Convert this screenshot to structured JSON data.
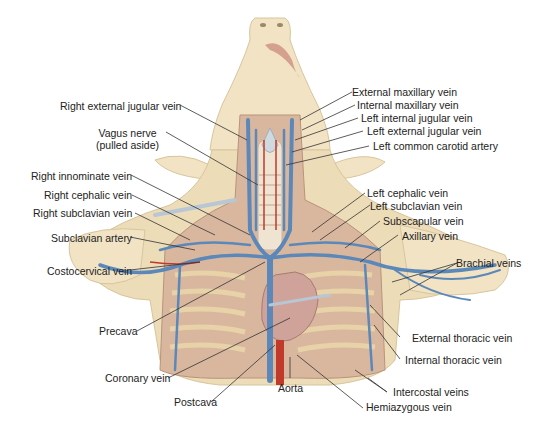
{
  "diagram": {
    "colors": {
      "skin": "#f1e3c4",
      "skin_shade": "#e3cfa4",
      "muscle": "#d9b79e",
      "vein": "#5b88b8",
      "artery": "#c0392b",
      "heart": "#cfa39a",
      "rib": "#e8d2a8",
      "line": "#333333"
    },
    "labels_left": [
      {
        "id": "right-external-jugular-vein",
        "text": "Right external jugular vein"
      },
      {
        "id": "vagus-nerve",
        "text": "Vagus nerve",
        "subtext": "(pulled aside)"
      },
      {
        "id": "right-innominate-vein",
        "text": "Right innominate vein"
      },
      {
        "id": "right-cephalic-vein",
        "text": "Right cephalic vein"
      },
      {
        "id": "right-subclavian-vein",
        "text": "Right subclavian vein"
      },
      {
        "id": "subclavian-artery",
        "text": "Subclavian artery"
      },
      {
        "id": "costocervical-vein",
        "text": "Costocervical vein"
      },
      {
        "id": "precava",
        "text": "Precava"
      },
      {
        "id": "coronary-vein",
        "text": "Coronary vein"
      }
    ],
    "labels_right": [
      {
        "id": "external-maxillary-vein",
        "text": "External maxillary vein"
      },
      {
        "id": "internal-maxillary-vein",
        "text": "Internal maxillary vein"
      },
      {
        "id": "left-internal-jugular-vein",
        "text": "Left internal jugular vein"
      },
      {
        "id": "left-external-jugular-vein",
        "text": "Left external jugular vein"
      },
      {
        "id": "left-common-carotid-artery",
        "text": "Left common carotid artery"
      },
      {
        "id": "left-cephalic-vein",
        "text": "Left cephalic vein"
      },
      {
        "id": "left-subclavian-vein",
        "text": "Left subclavian vein"
      },
      {
        "id": "subscapular-vein",
        "text": "Subscapular vein"
      },
      {
        "id": "axillary-vein",
        "text": "Axillary vein"
      },
      {
        "id": "brachial-veins",
        "text": "Brachial veins"
      },
      {
        "id": "external-thoracic-vein",
        "text": "External thoracic vein"
      },
      {
        "id": "internal-thoracic-vein",
        "text": "Internal thoracic vein"
      },
      {
        "id": "intercostal-veins",
        "text": "Intercostal veins"
      },
      {
        "id": "hemiazygous-vein",
        "text": "Hemiazygous vein"
      }
    ],
    "labels_bottom": [
      {
        "id": "postcava",
        "text": "Postcava"
      },
      {
        "id": "aorta",
        "text": "Aorta"
      }
    ]
  }
}
